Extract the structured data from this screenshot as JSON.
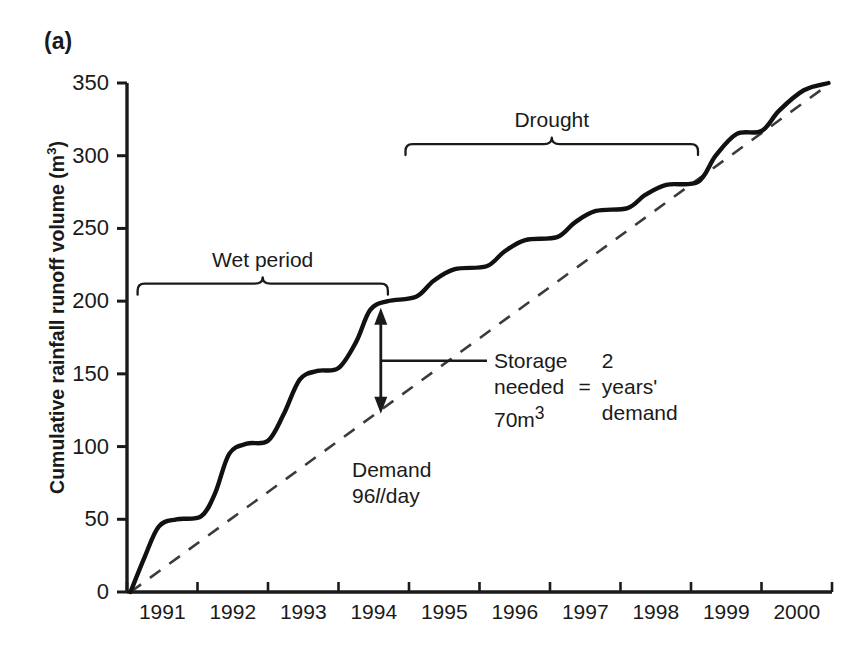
{
  "panel": {
    "label": "(a)"
  },
  "axes": {
    "y_title_main": "Cumulative rainfall runoff volume (m",
    "y_title_unit_sup": "3",
    "y_title_close": ")",
    "y_ticks": [
      "0",
      "50",
      "100",
      "150",
      "200",
      "250",
      "300",
      "350"
    ],
    "x_ticks": [
      "1991",
      "1992",
      "1993",
      "1994",
      "1995",
      "1996",
      "1997",
      "1998",
      "1999",
      "2000"
    ]
  },
  "brackets": {
    "wet": {
      "label": "Wet period"
    },
    "drought": {
      "label": "Drought"
    }
  },
  "annotations": {
    "demand_line1": "Demand",
    "demand_value": "96",
    "demand_unit_italic": "l",
    "demand_unit_rest": "/day",
    "storage_l1": "Storage",
    "storage_l2": "needed",
    "storage_l3_num": "70m",
    "storage_l3_sup": "3",
    "equals": "=",
    "years_l1": "2",
    "years_l2": "years'",
    "years_l3": "demand"
  },
  "colors": {
    "ink": "#1a1a1a",
    "curve": "#111111",
    "demand_line": "#444444",
    "background": "#ffffff"
  },
  "chart_data": {
    "type": "line",
    "title": "",
    "xlabel": "",
    "ylabel": "Cumulative rainfall runoff volume (m3)",
    "xlim": [
      1990.5,
      2000.5
    ],
    "ylim": [
      0,
      350
    ],
    "grid": false,
    "legend": "none",
    "x": [
      1991,
      1992,
      1993,
      1994,
      1995,
      1996,
      1997,
      1998,
      1999,
      2000
    ],
    "series": [
      {
        "name": "Cumulative rainfall runoff volume",
        "style": "solid-stepped",
        "annual_plateau_values": [
          50,
          102,
          152,
          200,
          222,
          242,
          262,
          280,
          315,
          350
        ],
        "points": [
          {
            "x": 1990.55,
            "y": 0
          },
          {
            "x": 1990.75,
            "y": 24
          },
          {
            "x": 1990.95,
            "y": 45
          },
          {
            "x": 1991.2,
            "y": 50
          },
          {
            "x": 1991.55,
            "y": 52
          },
          {
            "x": 1991.75,
            "y": 68
          },
          {
            "x": 1991.95,
            "y": 95
          },
          {
            "x": 1992.2,
            "y": 102
          },
          {
            "x": 1992.5,
            "y": 104
          },
          {
            "x": 1992.72,
            "y": 122
          },
          {
            "x": 1992.95,
            "y": 146
          },
          {
            "x": 1993.2,
            "y": 152
          },
          {
            "x": 1993.5,
            "y": 154
          },
          {
            "x": 1993.75,
            "y": 172
          },
          {
            "x": 1993.95,
            "y": 194
          },
          {
            "x": 1994.2,
            "y": 200
          },
          {
            "x": 1994.6,
            "y": 203
          },
          {
            "x": 1994.85,
            "y": 214
          },
          {
            "x": 1995.15,
            "y": 222
          },
          {
            "x": 1995.6,
            "y": 224
          },
          {
            "x": 1995.85,
            "y": 234
          },
          {
            "x": 1996.15,
            "y": 242
          },
          {
            "x": 1996.6,
            "y": 244
          },
          {
            "x": 1996.85,
            "y": 254
          },
          {
            "x": 1997.15,
            "y": 262
          },
          {
            "x": 1997.6,
            "y": 264
          },
          {
            "x": 1997.85,
            "y": 273
          },
          {
            "x": 1998.15,
            "y": 280
          },
          {
            "x": 1998.6,
            "y": 282
          },
          {
            "x": 1998.85,
            "y": 300
          },
          {
            "x": 1999.15,
            "y": 315
          },
          {
            "x": 1999.5,
            "y": 317
          },
          {
            "x": 1999.75,
            "y": 331
          },
          {
            "x": 2000.1,
            "y": 345
          },
          {
            "x": 2000.45,
            "y": 350
          }
        ]
      },
      {
        "name": "Demand 96 l/day",
        "style": "dashed-straight",
        "points": [
          {
            "x": 1990.55,
            "y": 0
          },
          {
            "x": 2000.45,
            "y": 349
          }
        ]
      }
    ],
    "annotations": [
      {
        "text": "Wet period",
        "type": "bracket",
        "x_start": 1990.65,
        "x_end": 1994.2,
        "y": 212
      },
      {
        "text": "Drought",
        "type": "bracket",
        "x_start": 1994.45,
        "x_end": 1998.6,
        "y": 308
      },
      {
        "text": "Storage needed 70m3 = 2 years' demand",
        "type": "arrow",
        "x": 1994.1,
        "y_top": 194,
        "y_bottom": 124,
        "value": 70,
        "unit": "m3"
      },
      {
        "text": "Demand 96 l/day",
        "type": "label",
        "x": 1994.1,
        "y": 98
      }
    ]
  }
}
